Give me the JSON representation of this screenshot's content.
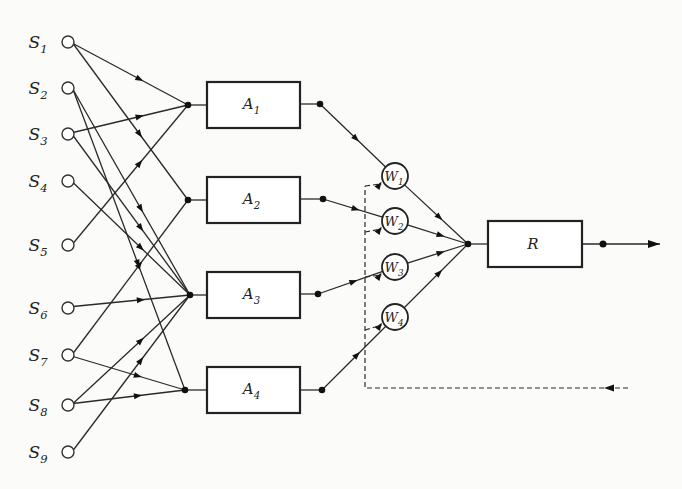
{
  "diagram": {
    "title": "",
    "sensors": [
      {
        "id": "S1",
        "letter": "S",
        "sub": "1"
      },
      {
        "id": "S2",
        "letter": "S",
        "sub": "2"
      },
      {
        "id": "S3",
        "letter": "S",
        "sub": "3"
      },
      {
        "id": "S4",
        "letter": "S",
        "sub": "4"
      },
      {
        "id": "S5",
        "letter": "S",
        "sub": "5"
      },
      {
        "id": "S6",
        "letter": "S",
        "sub": "6"
      },
      {
        "id": "S7",
        "letter": "S",
        "sub": "7"
      },
      {
        "id": "S8",
        "letter": "S",
        "sub": "8"
      },
      {
        "id": "S9",
        "letter": "S",
        "sub": "9"
      }
    ],
    "associators": [
      {
        "id": "A1",
        "letter": "A",
        "sub": "1"
      },
      {
        "id": "A2",
        "letter": "A",
        "sub": "2"
      },
      {
        "id": "A3",
        "letter": "A",
        "sub": "3"
      },
      {
        "id": "A4",
        "letter": "A",
        "sub": "4"
      }
    ],
    "weights": [
      {
        "id": "W1",
        "letter": "W",
        "sub": "1"
      },
      {
        "id": "W2",
        "letter": "W",
        "sub": "2"
      },
      {
        "id": "W3",
        "letter": "W",
        "sub": "3"
      },
      {
        "id": "W4",
        "letter": "W",
        "sub": "4"
      }
    ],
    "response": {
      "id": "R",
      "label": "R"
    },
    "edges_sensor_to_associator": [
      [
        "S1",
        "A1"
      ],
      [
        "S1",
        "A2"
      ],
      [
        "S2",
        "A3"
      ],
      [
        "S2",
        "A4"
      ],
      [
        "S3",
        "A1"
      ],
      [
        "S3",
        "A3"
      ],
      [
        "S4",
        "A3"
      ],
      [
        "S5",
        "A1"
      ],
      [
        "S6",
        "A3"
      ],
      [
        "S7",
        "A2"
      ],
      [
        "S7",
        "A4"
      ],
      [
        "S8",
        "A3"
      ],
      [
        "S8",
        "A4"
      ],
      [
        "S9",
        "A3"
      ]
    ],
    "edges_associator_to_weight": [
      [
        "A1",
        "W1"
      ],
      [
        "A2",
        "W2"
      ],
      [
        "A3",
        "W3"
      ],
      [
        "A4",
        "W4"
      ]
    ],
    "edges_weight_to_response": [
      [
        "W1",
        "R"
      ],
      [
        "W2",
        "R"
      ],
      [
        "W3",
        "R"
      ],
      [
        "W4",
        "R"
      ]
    ],
    "feedback": {
      "style": "dashed",
      "from": "external-right",
      "to": [
        "W1",
        "W2",
        "W3",
        "W4"
      ]
    },
    "output": {
      "from": "R",
      "direction": "right"
    }
  }
}
